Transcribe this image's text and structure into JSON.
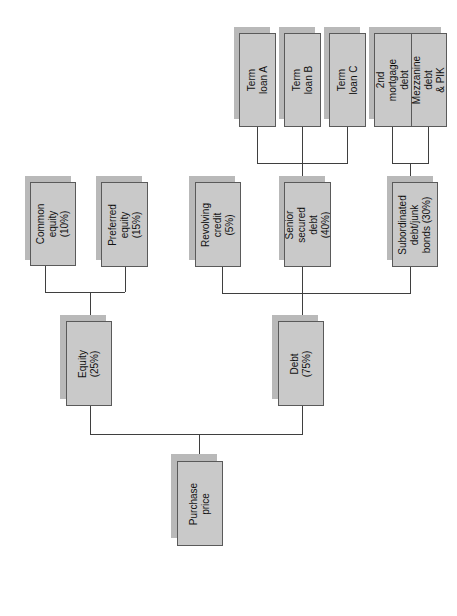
{
  "diagram": {
    "type": "tree",
    "orientation": "rotated-90-ccw",
    "colors": {
      "box_fill": "#c9c9c9",
      "box_shadow": "#b9b9b9",
      "box_border": "#5a5a5a",
      "line": "#3f3f3f"
    },
    "root": {
      "label": "Purchase price"
    },
    "level1": [
      {
        "label": "Equity (25%)"
      },
      {
        "label": "Debt (75%)"
      }
    ],
    "equity_children": [
      {
        "label": "Common\nequity (10%)"
      },
      {
        "label": "Preferred\nequity (15%)"
      }
    ],
    "debt_children": [
      {
        "label": "Revolving\ncredit (5%)"
      },
      {
        "label": "Senior secured\ndebt (40%)"
      },
      {
        "label": "Subordinated\ndebt/junk\nbonds (30%)"
      }
    ],
    "senior_children": [
      {
        "label": "Term loan A"
      },
      {
        "label": "Term loan B"
      },
      {
        "label": "Term loan C"
      }
    ],
    "subordinated_children": [
      {
        "label": "2nd mortgage\ndebt"
      },
      {
        "label": "Mezzanine debt\n& PIK"
      }
    ]
  }
}
